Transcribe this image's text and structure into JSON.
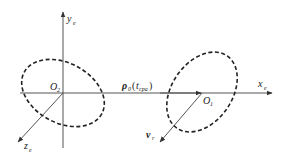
{
  "diagram": {
    "type": "coordinate-geometry",
    "labels": {
      "y_axis": {
        "main": "y",
        "sub": "e"
      },
      "x_axis": {
        "main": "x",
        "sub": "e"
      },
      "z_axis": {
        "main": "z",
        "sub": "e"
      },
      "origin_left": {
        "main": "O",
        "sub": "2"
      },
      "origin_right": {
        "main": "O",
        "sub": "1"
      },
      "rho": {
        "main": "ρ",
        "sub": "0",
        "arg_open": "(",
        "arg": "t",
        "arg_sub": "cpa",
        "arg_close": ")"
      },
      "velocity": {
        "main": "v",
        "sub": "r"
      }
    },
    "colors": {
      "line": "#444444",
      "ellipse": "#222222",
      "background": "#ffffff"
    }
  }
}
